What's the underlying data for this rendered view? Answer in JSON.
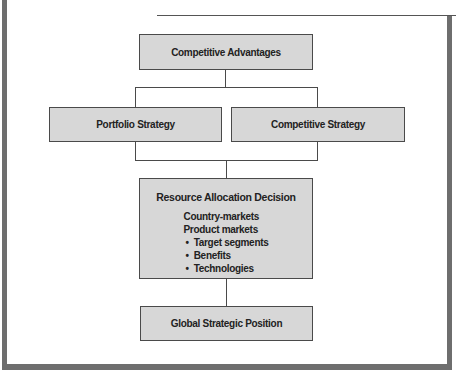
{
  "diagram": {
    "type": "flowchart",
    "nodes": {
      "competitive_advantages": "Competitive Advantages",
      "portfolio_strategy": "Portfolio Strategy",
      "competitive_strategy": "Competitive Strategy",
      "resource_allocation": {
        "title": "Resource Allocation Decision",
        "items": [
          "Country-markets",
          "Product markets"
        ],
        "bullets": [
          "Target segments",
          "Benefits",
          "Technologies"
        ]
      },
      "global_position": "Global Strategic Position"
    },
    "edges": [
      [
        "Competitive Advantages",
        "Portfolio Strategy"
      ],
      [
        "Competitive Advantages",
        "Competitive Strategy"
      ],
      [
        "Portfolio Strategy",
        "Resource Allocation Decision"
      ],
      [
        "Competitive Strategy",
        "Resource Allocation Decision"
      ],
      [
        "Resource Allocation Decision",
        "Global Strategic Position"
      ]
    ],
    "colors": {
      "box_fill": "#d7d7d7",
      "line": "#4a4a4a",
      "frame": "#6e6e6e"
    }
  }
}
